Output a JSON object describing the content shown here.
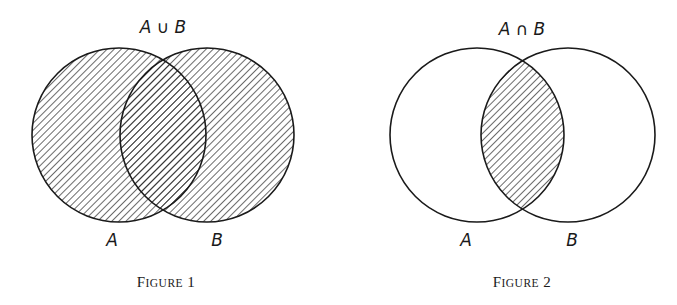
{
  "figures": [
    {
      "id": "figure-1",
      "title_label": "A ∪ B",
      "set_a_label": "A",
      "set_b_label": "B",
      "caption_first": "F",
      "caption_rest": "IGURE",
      "caption_number": "1",
      "shaded_region": "union"
    },
    {
      "id": "figure-2",
      "title_label": "A ∩ B",
      "set_a_label": "A",
      "set_b_label": "B",
      "caption_first": "F",
      "caption_rest": "IGURE",
      "caption_number": "2",
      "shaded_region": "intersection"
    }
  ]
}
